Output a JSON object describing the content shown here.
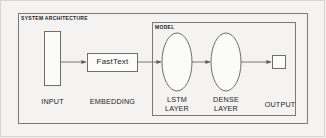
{
  "diagram": {
    "title": "SYSTEM ARCHITECTURE",
    "inner_group_title": "MODEL",
    "background_color": "#f2f1ef",
    "stroke_color": "#6e6e6e",
    "text_color": "#232323",
    "nodes": [
      {
        "id": "input",
        "label": "INPUT",
        "shape": "rectangle"
      },
      {
        "id": "embedding",
        "label": "EMBEDDING",
        "shape": "rectangle",
        "inner_label": "FastText"
      },
      {
        "id": "lstm",
        "label_line1": "LSTM",
        "label_line2": "LAYER",
        "shape": "ellipse"
      },
      {
        "id": "dense",
        "label_line1": "DENSE",
        "label_line2": "LAYER",
        "shape": "ellipse"
      },
      {
        "id": "output",
        "label": "OUTPUT",
        "shape": "square"
      }
    ],
    "edges": [
      {
        "from": "input",
        "to": "embedding",
        "arrow": "true"
      },
      {
        "from": "embedding",
        "to": "lstm",
        "arrow": "true"
      },
      {
        "from": "lstm",
        "to": "dense",
        "arrow": "true"
      },
      {
        "from": "dense",
        "to": "output",
        "arrow": "true"
      }
    ]
  }
}
